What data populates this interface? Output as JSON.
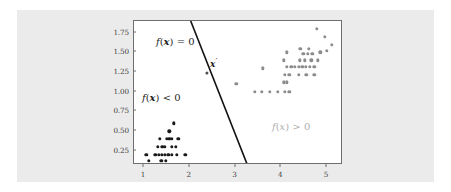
{
  "figure": {
    "background_color": "#ebebeb",
    "plot_background_color": "#ffffff",
    "frame_color": "#6e6e6e"
  },
  "annotations": {
    "boundary_label": {
      "f": "f",
      "open": "(",
      "var": "x",
      "close": ")",
      "rel": " = 0",
      "color": "#1f1f1f"
    },
    "negative_region_label": {
      "f": "f",
      "open": "(",
      "var": "x",
      "close": ")",
      "rel": " < 0",
      "color": "#1f1f1f"
    },
    "positive_region_label": {
      "f": "f",
      "open": "(",
      "var": "x",
      "close": ")",
      "rel": " > 0",
      "color": "#b0b0b0"
    },
    "test_point_label": {
      "var": "x",
      "prime": "′",
      "color": "#1f1f1f"
    }
  },
  "chart_data": {
    "type": "scatter",
    "title": "",
    "xlabel": "",
    "ylabel": "",
    "xlim": [
      0.78,
      5.35
    ],
    "ylim": [
      0.07,
      1.9
    ],
    "grid": false,
    "legend": "none",
    "xticks": [
      1,
      2,
      3,
      4,
      5
    ],
    "xtick_labels": [
      "1",
      "2",
      "3",
      "4",
      "5"
    ],
    "yticks": [
      0.25,
      0.5,
      0.75,
      1.0,
      1.25,
      1.5,
      1.75
    ],
    "ytick_labels": [
      "0.25",
      "0.50",
      "0.75",
      "1.00",
      "1.25",
      "1.50",
      "1.75"
    ],
    "series": [
      {
        "name": "negative class",
        "label": "f(x) < 0",
        "color": "#1a1a1a",
        "marker": "circle",
        "points": [
          [
            1.65,
            0.6
          ],
          [
            1.55,
            0.5
          ],
          [
            1.35,
            0.4
          ],
          [
            1.5,
            0.4
          ],
          [
            1.55,
            0.4
          ],
          [
            1.6,
            0.4
          ],
          [
            1.75,
            0.4
          ],
          [
            1.3,
            0.3
          ],
          [
            1.4,
            0.3
          ],
          [
            1.45,
            0.3
          ],
          [
            1.6,
            0.3
          ],
          [
            1.7,
            0.3
          ],
          [
            1.05,
            0.2
          ],
          [
            1.25,
            0.2
          ],
          [
            1.32,
            0.2
          ],
          [
            1.39,
            0.2
          ],
          [
            1.46,
            0.2
          ],
          [
            1.53,
            0.2
          ],
          [
            1.6,
            0.2
          ],
          [
            1.72,
            0.2
          ],
          [
            1.9,
            0.2
          ],
          [
            1.1,
            0.12
          ],
          [
            1.38,
            0.12
          ],
          [
            1.48,
            0.12
          ]
        ]
      },
      {
        "name": "positive class",
        "label": "f(x) > 0",
        "color": "#8c8c8c",
        "marker": "circle",
        "points": [
          [
            4.78,
            1.8
          ],
          [
            4.95,
            1.7
          ],
          [
            5.1,
            1.6
          ],
          [
            4.42,
            1.55
          ],
          [
            4.6,
            1.55
          ],
          [
            5.0,
            1.52
          ],
          [
            4.12,
            1.5
          ],
          [
            4.48,
            1.48
          ],
          [
            4.58,
            1.48
          ],
          [
            4.68,
            1.48
          ],
          [
            4.85,
            1.5
          ],
          [
            4.05,
            1.4
          ],
          [
            4.4,
            1.4
          ],
          [
            4.52,
            1.4
          ],
          [
            4.66,
            1.4
          ],
          [
            4.8,
            1.4
          ],
          [
            3.6,
            1.3
          ],
          [
            4.12,
            1.32
          ],
          [
            4.22,
            1.32
          ],
          [
            4.3,
            1.32
          ],
          [
            4.38,
            1.32
          ],
          [
            4.46,
            1.32
          ],
          [
            4.54,
            1.32
          ],
          [
            4.62,
            1.32
          ],
          [
            4.72,
            1.32
          ],
          [
            4.08,
            1.22
          ],
          [
            4.18,
            1.22
          ],
          [
            4.38,
            1.22
          ],
          [
            4.55,
            1.22
          ],
          [
            4.72,
            1.22
          ],
          [
            3.02,
            1.1
          ],
          [
            4.05,
            1.12
          ],
          [
            4.12,
            1.12
          ],
          [
            3.42,
            1.0
          ],
          [
            3.58,
            1.0
          ],
          [
            3.75,
            1.0
          ],
          [
            3.92,
            1.0
          ],
          [
            4.08,
            1.0
          ],
          [
            4.18,
            1.0
          ]
        ]
      },
      {
        "name": "query point",
        "label": "x'",
        "color": "#4d4d4d",
        "marker": "circle",
        "points": [
          [
            2.38,
            1.24
          ]
        ]
      }
    ],
    "decision_boundary": {
      "label": "f(x) = 0",
      "color": "#111111",
      "type": "line",
      "endpoints": [
        [
          2.02,
          1.9
        ],
        [
          3.26,
          0.07
        ]
      ]
    }
  }
}
